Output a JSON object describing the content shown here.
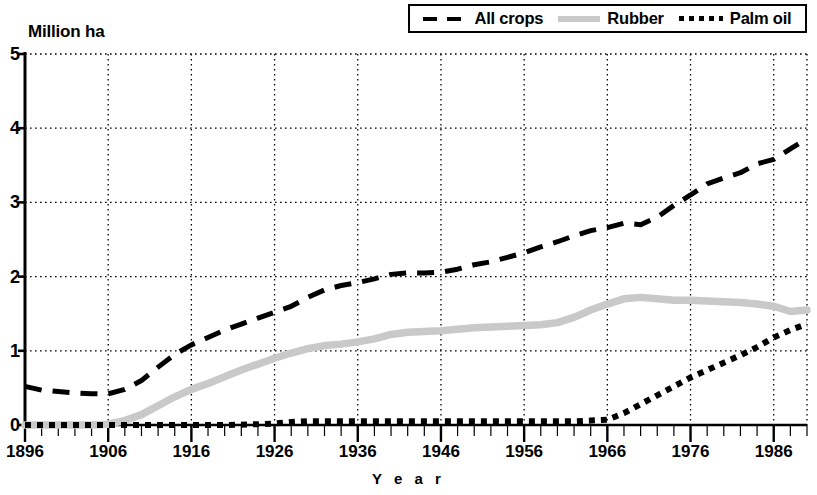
{
  "legend": {
    "items": [
      {
        "label": "All crops",
        "style": "dashed",
        "color": "#000000",
        "icon": "dashed-line-swatch"
      },
      {
        "label": "Rubber",
        "style": "solid",
        "color": "#c9c9c9",
        "icon": "solid-line-swatch"
      },
      {
        "label": "Palm oil",
        "style": "dotted",
        "color": "#000000",
        "icon": "dotted-line-swatch"
      }
    ]
  },
  "axes": {
    "y_unit_label": "Million ha",
    "x_title": "Y e a r",
    "y_ticks": [
      "0",
      "1",
      "2",
      "3",
      "4",
      "5"
    ],
    "x_ticks": [
      "1896",
      "1906",
      "1916",
      "1926",
      "1936",
      "1946",
      "1956",
      "1966",
      "1976",
      "1986"
    ]
  },
  "chart_data": {
    "type": "line",
    "title": "",
    "subtitle": "",
    "xlabel": "Y e a r",
    "ylabel": "Million ha",
    "xlim": [
      1896,
      1990
    ],
    "ylim": [
      0,
      5
    ],
    "grid": true,
    "legend_position": "top-right",
    "x_tick_labels": [
      1896,
      1906,
      1916,
      1926,
      1936,
      1946,
      1956,
      1966,
      1976,
      1986
    ],
    "y_tick_labels": [
      0,
      1,
      2,
      3,
      4,
      5
    ],
    "x_minor_tick_interval": 2,
    "series": [
      {
        "name": "All crops",
        "style": "dashed",
        "color": "#000000",
        "x": [
          1896,
          1898,
          1900,
          1902,
          1904,
          1906,
          1908,
          1910,
          1912,
          1914,
          1916,
          1918,
          1920,
          1922,
          1924,
          1926,
          1928,
          1930,
          1932,
          1934,
          1936,
          1938,
          1940,
          1942,
          1944,
          1946,
          1948,
          1950,
          1952,
          1954,
          1956,
          1958,
          1960,
          1962,
          1964,
          1966,
          1968,
          1970,
          1972,
          1974,
          1976,
          1978,
          1980,
          1982,
          1984,
          1986,
          1988,
          1990
        ],
        "values": [
          0.52,
          0.47,
          0.45,
          0.43,
          0.42,
          0.42,
          0.48,
          0.6,
          0.78,
          0.95,
          1.08,
          1.18,
          1.28,
          1.36,
          1.44,
          1.52,
          1.6,
          1.72,
          1.82,
          1.88,
          1.92,
          1.97,
          2.03,
          2.05,
          2.05,
          2.06,
          2.1,
          2.16,
          2.2,
          2.26,
          2.32,
          2.4,
          2.47,
          2.55,
          2.62,
          2.66,
          2.72,
          2.7,
          2.8,
          2.96,
          3.1,
          3.25,
          3.33,
          3.4,
          3.52,
          3.58,
          3.72,
          3.86
        ]
      },
      {
        "name": "Rubber",
        "style": "solid",
        "color": "#c9c9c9",
        "x": [
          1896,
          1900,
          1904,
          1906,
          1908,
          1910,
          1912,
          1914,
          1916,
          1918,
          1920,
          1922,
          1924,
          1926,
          1928,
          1930,
          1932,
          1934,
          1936,
          1938,
          1940,
          1942,
          1944,
          1946,
          1948,
          1950,
          1952,
          1954,
          1956,
          1958,
          1960,
          1962,
          1964,
          1966,
          1968,
          1970,
          1972,
          1974,
          1976,
          1978,
          1980,
          1982,
          1984,
          1986,
          1988,
          1990
        ],
        "values": [
          0.0,
          0.0,
          0.0,
          0.01,
          0.06,
          0.14,
          0.26,
          0.38,
          0.48,
          0.56,
          0.65,
          0.74,
          0.82,
          0.9,
          0.97,
          1.03,
          1.07,
          1.09,
          1.12,
          1.16,
          1.22,
          1.25,
          1.26,
          1.27,
          1.29,
          1.31,
          1.32,
          1.33,
          1.34,
          1.35,
          1.38,
          1.45,
          1.55,
          1.63,
          1.7,
          1.72,
          1.7,
          1.68,
          1.68,
          1.67,
          1.66,
          1.65,
          1.63,
          1.6,
          1.53,
          1.55
        ]
      },
      {
        "name": "Palm oil",
        "style": "dotted",
        "color": "#000000",
        "x": [
          1896,
          1906,
          1916,
          1920,
          1924,
          1926,
          1928,
          1930,
          1932,
          1934,
          1936,
          1940,
          1944,
          1948,
          1952,
          1956,
          1960,
          1962,
          1964,
          1966,
          1968,
          1970,
          1972,
          1974,
          1976,
          1978,
          1980,
          1982,
          1984,
          1986,
          1988,
          1990
        ],
        "values": [
          0.0,
          0.0,
          0.0,
          0.0,
          0.01,
          0.02,
          0.04,
          0.05,
          0.05,
          0.05,
          0.05,
          0.05,
          0.05,
          0.05,
          0.05,
          0.05,
          0.05,
          0.05,
          0.06,
          0.07,
          0.16,
          0.28,
          0.4,
          0.52,
          0.64,
          0.74,
          0.84,
          0.94,
          1.05,
          1.18,
          1.28,
          1.36
        ]
      }
    ]
  }
}
